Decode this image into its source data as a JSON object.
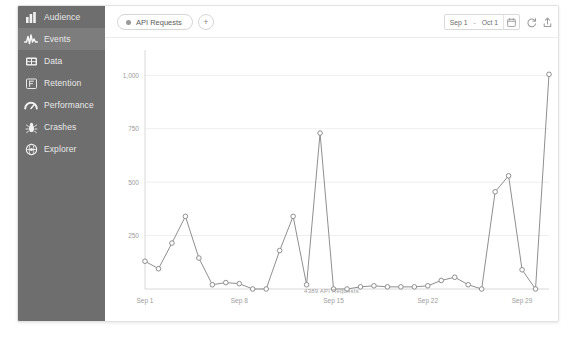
{
  "sidebar": {
    "items": [
      {
        "label": "Audience",
        "icon": "bar-chart-icon",
        "active": false
      },
      {
        "label": "Events",
        "icon": "pulse-icon",
        "active": true
      },
      {
        "label": "Data",
        "icon": "grid-table-icon",
        "active": false
      },
      {
        "label": "Retention",
        "icon": "funnel-f-icon",
        "active": false
      },
      {
        "label": "Performance",
        "icon": "speedometer-icon",
        "active": false
      },
      {
        "label": "Crashes",
        "icon": "bug-icon",
        "active": false
      },
      {
        "label": "Explorer",
        "icon": "globe-icon",
        "active": false
      }
    ]
  },
  "toolbar": {
    "chip_label": "API Requests",
    "chip_dot_icon": "series-dot-icon",
    "add_label": "+",
    "add_icon": "plus-icon",
    "date_start": "Sep 1",
    "date_separator": "-",
    "date_end": "Oct 1",
    "calendar_icon": "calendar-icon",
    "refresh_icon": "refresh-icon",
    "share_icon": "share-icon"
  },
  "colors": {
    "sidebar_bg": "#6e6e6e",
    "sidebar_active": "#7d7d7d",
    "line": "#8f8f8f",
    "grid": "#eeeeee",
    "axis": "#d8d8d8",
    "text_muted": "#a0a0a0"
  },
  "chart_data": {
    "type": "line",
    "title": "",
    "caption": "4389 API Requests",
    "xlabel": "",
    "ylabel": "",
    "ylim": [
      0,
      1100
    ],
    "yticks": [
      250,
      500,
      750,
      1000
    ],
    "ytick_labels": [
      "250",
      "500",
      "750",
      "1,000"
    ],
    "grid": true,
    "legend": "none",
    "xtick_indices": [
      0,
      7,
      14,
      21,
      28
    ],
    "xtick_labels": [
      "Sep 1",
      "Sep 8",
      "Sep 15",
      "Sep 22",
      "Sep 29"
    ],
    "series": [
      {
        "name": "API Requests",
        "color": "#8f8f8f",
        "marker": "circle",
        "x": [
          "Sep 1",
          "Sep 2",
          "Sep 3",
          "Sep 4",
          "Sep 5",
          "Sep 6",
          "Sep 7",
          "Sep 8",
          "Sep 9",
          "Sep 10",
          "Sep 11",
          "Sep 12",
          "Sep 13",
          "Sep 14",
          "Sep 15",
          "Sep 16",
          "Sep 17",
          "Sep 18",
          "Sep 19",
          "Sep 20",
          "Sep 21",
          "Sep 22",
          "Sep 23",
          "Sep 24",
          "Sep 25",
          "Sep 26",
          "Sep 27",
          "Sep 28",
          "Sep 29",
          "Sep 30",
          "Oct 1"
        ],
        "values": [
          130,
          95,
          215,
          340,
          145,
          20,
          30,
          25,
          0,
          0,
          180,
          340,
          20,
          730,
          0,
          0,
          10,
          15,
          10,
          10,
          10,
          15,
          40,
          55,
          20,
          0,
          455,
          530,
          90,
          0,
          1005
        ]
      }
    ]
  }
}
